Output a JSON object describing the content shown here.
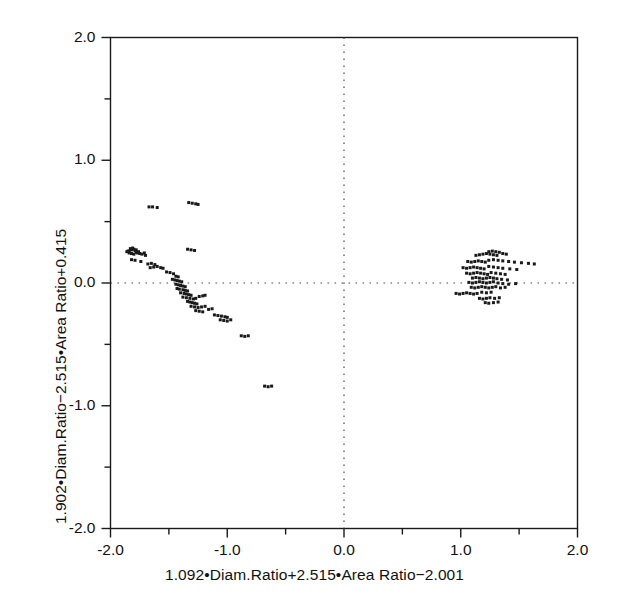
{
  "figure": {
    "background": "#ffffff",
    "ink": "#1a1a1a",
    "marker_color": "#1a1a1a"
  },
  "chart_data": {
    "type": "scatter",
    "title": "",
    "xlabel": "1.092•Diam.Ratio+2.515•Area Ratio−2.001",
    "ylabel": "1.902•Diam.Ratio−2.515•Area Ratio+0.415",
    "xlim": [
      -2.0,
      2.0
    ],
    "ylim": [
      -2.0,
      2.0
    ],
    "xticks": [
      -2.0,
      -1.0,
      0.0,
      1.0,
      2.0
    ],
    "yticks": [
      -2.0,
      -1.0,
      0.0,
      1.0,
      2.0
    ],
    "xtick_labels": [
      "-2.0",
      "-1.0",
      "0.0",
      "1.0",
      "2.0"
    ],
    "ytick_labels": [
      "-2.0",
      "-1.0",
      "0.0",
      "1.0",
      "2.0"
    ],
    "minor_tick_step": 0.5,
    "grid": false,
    "reference_lines": [
      {
        "name": "horizontal-zero-line",
        "axis": "y",
        "value": 0.0,
        "style": "dotted"
      },
      {
        "name": "vertical-zero-line",
        "axis": "x",
        "value": 0.0,
        "style": "dotted"
      }
    ],
    "legend": null,
    "marker": {
      "shape": "square",
      "size_px": 3
    },
    "series": [
      {
        "name": "group-left",
        "points": [
          [
            -1.67,
            0.62
          ],
          [
            -1.64,
            0.62
          ],
          [
            -1.6,
            0.615
          ],
          [
            -1.33,
            0.655
          ],
          [
            -1.3,
            0.65
          ],
          [
            -1.27,
            0.645
          ],
          [
            -1.25,
            0.64
          ],
          [
            -1.86,
            0.255
          ],
          [
            -1.84,
            0.26
          ],
          [
            -1.82,
            0.27
          ],
          [
            -1.8,
            0.275
          ],
          [
            -1.79,
            0.265
          ],
          [
            -1.78,
            0.25
          ],
          [
            -1.77,
            0.245
          ],
          [
            -1.8,
            0.235
          ],
          [
            -1.82,
            0.24
          ],
          [
            -1.84,
            0.245
          ],
          [
            -1.85,
            0.26
          ],
          [
            -1.83,
            0.28
          ],
          [
            -1.81,
            0.285
          ],
          [
            -1.78,
            0.27
          ],
          [
            -1.76,
            0.255
          ],
          [
            -1.75,
            0.24
          ],
          [
            -1.73,
            0.235
          ],
          [
            -1.71,
            0.245
          ],
          [
            -1.7,
            0.225
          ],
          [
            -1.34,
            0.275
          ],
          [
            -1.31,
            0.27
          ],
          [
            -1.28,
            0.265
          ],
          [
            -1.82,
            0.19
          ],
          [
            -1.79,
            0.185
          ],
          [
            -1.74,
            0.175
          ],
          [
            -1.68,
            0.155
          ],
          [
            -1.65,
            0.16
          ],
          [
            -1.62,
            0.15
          ],
          [
            -1.66,
            0.125
          ],
          [
            -1.63,
            0.13
          ],
          [
            -1.6,
            0.135
          ],
          [
            -1.57,
            0.125
          ],
          [
            -1.55,
            0.12
          ],
          [
            -1.52,
            0.09
          ],
          [
            -1.49,
            0.085
          ],
          [
            -1.46,
            0.075
          ],
          [
            -1.44,
            0.055
          ],
          [
            -1.42,
            0.05
          ],
          [
            -1.47,
            0.03
          ],
          [
            -1.45,
            0.025
          ],
          [
            -1.43,
            0.02
          ],
          [
            -1.41,
            0.015
          ],
          [
            -1.39,
            0.01
          ],
          [
            -1.44,
            -0.01
          ],
          [
            -1.42,
            -0.015
          ],
          [
            -1.4,
            -0.02
          ],
          [
            -1.38,
            -0.025
          ],
          [
            -1.36,
            -0.03
          ],
          [
            -1.43,
            -0.045
          ],
          [
            -1.41,
            -0.05
          ],
          [
            -1.38,
            -0.055
          ],
          [
            -1.36,
            -0.06
          ],
          [
            -1.34,
            -0.065
          ],
          [
            -1.4,
            -0.08
          ],
          [
            -1.37,
            -0.085
          ],
          [
            -1.35,
            -0.09
          ],
          [
            -1.33,
            -0.095
          ],
          [
            -1.31,
            -0.1
          ],
          [
            -1.38,
            -0.115
          ],
          [
            -1.35,
            -0.12
          ],
          [
            -1.32,
            -0.125
          ],
          [
            -1.29,
            -0.13
          ],
          [
            -1.27,
            -0.125
          ],
          [
            -1.24,
            -0.11
          ],
          [
            -1.21,
            -0.105
          ],
          [
            -1.19,
            -0.1
          ],
          [
            -1.34,
            -0.15
          ],
          [
            -1.32,
            -0.155
          ],
          [
            -1.3,
            -0.16
          ],
          [
            -1.28,
            -0.165
          ],
          [
            -1.26,
            -0.17
          ],
          [
            -1.31,
            -0.19
          ],
          [
            -1.28,
            -0.195
          ],
          [
            -1.25,
            -0.2
          ],
          [
            -1.22,
            -0.195
          ],
          [
            -1.19,
            -0.19
          ],
          [
            -1.27,
            -0.225
          ],
          [
            -1.24,
            -0.23
          ],
          [
            -1.21,
            -0.235
          ],
          [
            -1.16,
            -0.215
          ],
          [
            -1.13,
            -0.21
          ],
          [
            -1.11,
            -0.26
          ],
          [
            -1.08,
            -0.265
          ],
          [
            -1.05,
            -0.27
          ],
          [
            -1.02,
            -0.275
          ],
          [
            -1.0,
            -0.28
          ],
          [
            -1.06,
            -0.3
          ],
          [
            -1.03,
            -0.305
          ],
          [
            -1.0,
            -0.31
          ],
          [
            -0.97,
            -0.3
          ],
          [
            -0.88,
            -0.43
          ],
          [
            -0.85,
            -0.435
          ],
          [
            -0.82,
            -0.43
          ],
          [
            -0.68,
            -0.84
          ],
          [
            -0.65,
            -0.845
          ],
          [
            -0.62,
            -0.84
          ]
        ]
      },
      {
        "name": "group-right",
        "points": [
          [
            1.13,
            0.225
          ],
          [
            1.16,
            0.23
          ],
          [
            1.19,
            0.235
          ],
          [
            1.22,
            0.24
          ],
          [
            1.25,
            0.235
          ],
          [
            1.28,
            0.23
          ],
          [
            1.31,
            0.225
          ],
          [
            1.24,
            0.255
          ],
          [
            1.27,
            0.26
          ],
          [
            1.3,
            0.255
          ],
          [
            1.33,
            0.25
          ],
          [
            1.36,
            0.24
          ],
          [
            1.39,
            0.235
          ],
          [
            1.06,
            0.175
          ],
          [
            1.09,
            0.17
          ],
          [
            1.12,
            0.175
          ],
          [
            1.15,
            0.18
          ],
          [
            1.18,
            0.175
          ],
          [
            1.21,
            0.17
          ],
          [
            1.24,
            0.185
          ],
          [
            1.28,
            0.19
          ],
          [
            1.32,
            0.185
          ],
          [
            1.36,
            0.18
          ],
          [
            1.41,
            0.175
          ],
          [
            1.46,
            0.17
          ],
          [
            1.52,
            0.165
          ],
          [
            1.58,
            0.16
          ],
          [
            1.63,
            0.155
          ],
          [
            1.02,
            0.125
          ],
          [
            1.05,
            0.12
          ],
          [
            1.08,
            0.125
          ],
          [
            1.11,
            0.13
          ],
          [
            1.14,
            0.125
          ],
          [
            1.17,
            0.12
          ],
          [
            1.2,
            0.115
          ],
          [
            1.24,
            0.135
          ],
          [
            1.28,
            0.13
          ],
          [
            1.32,
            0.125
          ],
          [
            1.36,
            0.12
          ],
          [
            1.42,
            0.115
          ],
          [
            1.48,
            0.11
          ],
          [
            1.05,
            0.08
          ],
          [
            1.08,
            0.075
          ],
          [
            1.11,
            0.08
          ],
          [
            1.14,
            0.085
          ],
          [
            1.17,
            0.08
          ],
          [
            1.2,
            0.075
          ],
          [
            1.23,
            0.07
          ],
          [
            1.26,
            0.085
          ],
          [
            1.3,
            0.08
          ],
          [
            1.34,
            0.075
          ],
          [
            1.38,
            0.07
          ],
          [
            1.1,
            0.04
          ],
          [
            1.13,
            0.045
          ],
          [
            1.16,
            0.04
          ],
          [
            1.19,
            0.035
          ],
          [
            1.22,
            0.04
          ],
          [
            1.25,
            0.045
          ],
          [
            1.28,
            0.04
          ],
          [
            1.31,
            0.035
          ],
          [
            1.35,
            0.03
          ],
          [
            1.4,
            0.025
          ],
          [
            1.07,
            0.005
          ],
          [
            1.1,
            0.0
          ],
          [
            1.13,
            0.005
          ],
          [
            1.16,
            0.01
          ],
          [
            1.19,
            0.005
          ],
          [
            1.22,
            0.0
          ],
          [
            1.25,
            0.005
          ],
          [
            1.28,
            0.01
          ],
          [
            1.32,
            0.0
          ],
          [
            1.36,
            -0.005
          ],
          [
            1.41,
            -0.01
          ],
          [
            1.47,
            -0.005
          ],
          [
            1.09,
            -0.035
          ],
          [
            1.12,
            -0.04
          ],
          [
            1.15,
            -0.035
          ],
          [
            1.18,
            -0.03
          ],
          [
            1.21,
            -0.035
          ],
          [
            1.24,
            -0.04
          ],
          [
            1.27,
            -0.035
          ],
          [
            1.3,
            -0.03
          ],
          [
            1.34,
            -0.04
          ],
          [
            1.38,
            -0.035
          ],
          [
            0.96,
            -0.085
          ],
          [
            0.99,
            -0.09
          ],
          [
            1.02,
            -0.085
          ],
          [
            1.05,
            -0.08
          ],
          [
            1.08,
            -0.085
          ],
          [
            1.11,
            -0.09
          ],
          [
            1.14,
            -0.085
          ],
          [
            1.18,
            -0.075
          ],
          [
            1.22,
            -0.08
          ],
          [
            1.26,
            -0.075
          ],
          [
            1.16,
            -0.125
          ],
          [
            1.19,
            -0.13
          ],
          [
            1.22,
            -0.125
          ],
          [
            1.25,
            -0.12
          ],
          [
            1.29,
            -0.125
          ],
          [
            1.33,
            -0.12
          ],
          [
            1.21,
            -0.16
          ],
          [
            1.24,
            -0.165
          ],
          [
            1.28,
            -0.16
          ],
          [
            1.32,
            -0.155
          ]
        ]
      }
    ]
  }
}
